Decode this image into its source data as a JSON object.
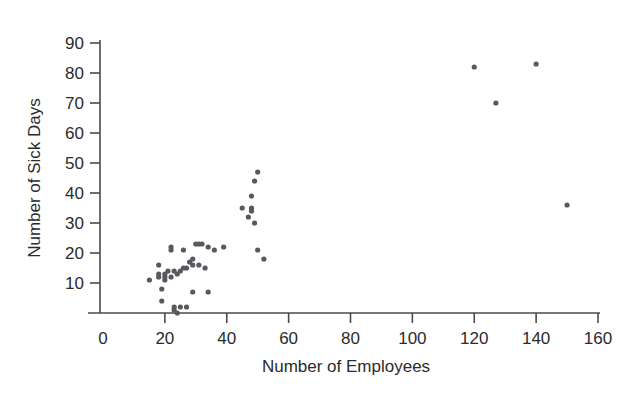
{
  "chart_data": {
    "type": "scatter",
    "title": "",
    "xlabel": "Number of Employees",
    "ylabel": "Number of Sick Days",
    "xlim": [
      0,
      160
    ],
    "ylim": [
      0,
      90
    ],
    "xticks": [
      0,
      20,
      40,
      60,
      80,
      100,
      120,
      140,
      160
    ],
    "yticks": [
      10,
      20,
      30,
      40,
      50,
      60,
      70,
      80,
      90
    ],
    "grid": false,
    "legend": null,
    "marker_color": "#58585e",
    "axis_color": "#4a4a4a",
    "points": [
      {
        "x": 15,
        "y": 11
      },
      {
        "x": 18,
        "y": 16
      },
      {
        "x": 18,
        "y": 13
      },
      {
        "x": 18,
        "y": 12
      },
      {
        "x": 19,
        "y": 8
      },
      {
        "x": 19,
        "y": 4
      },
      {
        "x": 20,
        "y": 13
      },
      {
        "x": 20,
        "y": 12
      },
      {
        "x": 20,
        "y": 11
      },
      {
        "x": 21,
        "y": 14
      },
      {
        "x": 22,
        "y": 22
      },
      {
        "x": 22,
        "y": 21
      },
      {
        "x": 22,
        "y": 12
      },
      {
        "x": 23,
        "y": 14
      },
      {
        "x": 23,
        "y": 2
      },
      {
        "x": 23,
        "y": 1
      },
      {
        "x": 24,
        "y": 13
      },
      {
        "x": 24,
        "y": 0
      },
      {
        "x": 25,
        "y": 14
      },
      {
        "x": 25,
        "y": 2
      },
      {
        "x": 26,
        "y": 21
      },
      {
        "x": 26,
        "y": 15
      },
      {
        "x": 27,
        "y": 15
      },
      {
        "x": 27,
        "y": 2
      },
      {
        "x": 28,
        "y": 17
      },
      {
        "x": 29,
        "y": 18
      },
      {
        "x": 29,
        "y": 16
      },
      {
        "x": 29,
        "y": 7
      },
      {
        "x": 30,
        "y": 23
      },
      {
        "x": 31,
        "y": 23
      },
      {
        "x": 31,
        "y": 16
      },
      {
        "x": 32,
        "y": 23
      },
      {
        "x": 33,
        "y": 15
      },
      {
        "x": 34,
        "y": 22
      },
      {
        "x": 34,
        "y": 7
      },
      {
        "x": 36,
        "y": 21
      },
      {
        "x": 39,
        "y": 22
      },
      {
        "x": 45,
        "y": 35
      },
      {
        "x": 47,
        "y": 32
      },
      {
        "x": 48,
        "y": 39
      },
      {
        "x": 48,
        "y": 35
      },
      {
        "x": 48,
        "y": 34
      },
      {
        "x": 49,
        "y": 44
      },
      {
        "x": 49,
        "y": 30
      },
      {
        "x": 50,
        "y": 47
      },
      {
        "x": 50,
        "y": 21
      },
      {
        "x": 52,
        "y": 18
      },
      {
        "x": 120,
        "y": 82
      },
      {
        "x": 127,
        "y": 70
      },
      {
        "x": 140,
        "y": 83
      },
      {
        "x": 150,
        "y": 36
      }
    ]
  },
  "caption": {
    "top_partial": ""
  }
}
